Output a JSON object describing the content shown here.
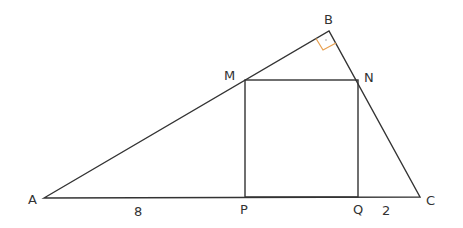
{
  "diagram": {
    "type": "geometry",
    "colors": {
      "line": "#333333",
      "right_angle_marker": "#e8a050"
    },
    "points": {
      "A": {
        "label": "A",
        "x": 44,
        "y": 198
      },
      "B": {
        "label": "B",
        "x": 329,
        "y": 31
      },
      "C": {
        "label": "C",
        "x": 420,
        "y": 197
      },
      "M": {
        "label": "M",
        "x": 245,
        "y": 80
      },
      "N": {
        "label": "N",
        "x": 358,
        "y": 80
      },
      "P": {
        "label": "P",
        "x": 245,
        "y": 197
      },
      "Q": {
        "label": "Q",
        "x": 358,
        "y": 197
      }
    },
    "measurements": {
      "AP": "8",
      "QC": "2"
    },
    "right_angle_at": "B"
  }
}
